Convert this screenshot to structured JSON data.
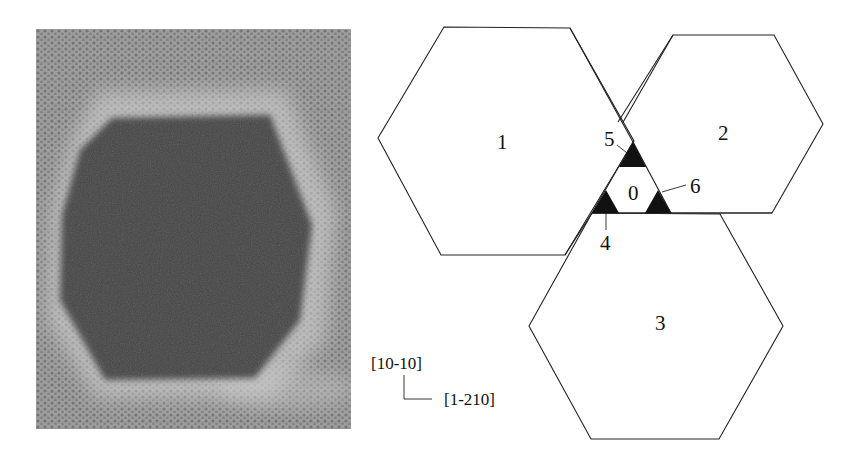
{
  "figure": {
    "left_panel": {
      "type": "micrograph",
      "description": "lattice image with dark hexagonal particle",
      "colors": {
        "background": "#8e8e8e",
        "halo": "#cfcfcf",
        "particle": "#454545"
      }
    },
    "schematic": {
      "hexagons": [
        {
          "id": "1",
          "label": "1"
        },
        {
          "id": "2",
          "label": "2"
        },
        {
          "id": "3",
          "label": "3"
        }
      ],
      "center_region": {
        "label": "0"
      },
      "corner_triangles": [
        {
          "label": "4"
        },
        {
          "label": "5"
        },
        {
          "label": "6"
        }
      ],
      "colors": {
        "stroke": "#222222",
        "fill": "#ffffff",
        "triangle_fill": "#111111"
      }
    },
    "axes": {
      "vertical": "[10-10]",
      "horizontal": "[1-210]"
    }
  }
}
